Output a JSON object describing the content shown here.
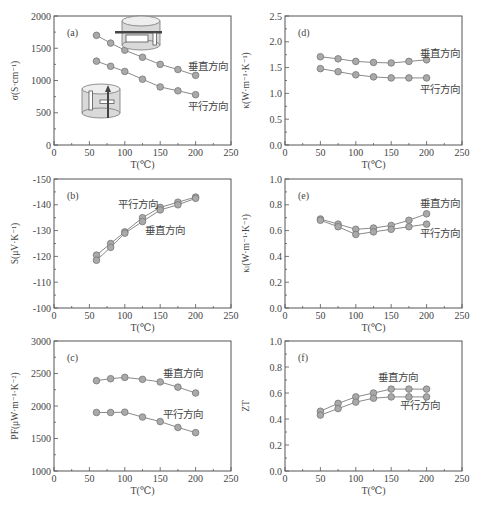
{
  "figure": {
    "width": 480,
    "height": 513
  },
  "series_names": {
    "perpendicular": "垂直方向",
    "parallel": "平行方向"
  },
  "chart_data": [
    {
      "id": "a",
      "type": "line",
      "panel_label": "(a)",
      "xlabel": "T(℃)",
      "ylabel": "σ(S·cm⁻¹)",
      "xlim": [
        0,
        250
      ],
      "ylim": [
        0,
        2000
      ],
      "xticks": [
        0,
        50,
        100,
        150,
        200,
        250
      ],
      "yticks": [
        0,
        500,
        1000,
        1500,
        2000
      ],
      "x": [
        60,
        80,
        100,
        125,
        150,
        175,
        200
      ],
      "series": [
        {
          "name": "垂直方向",
          "values": [
            1700,
            1580,
            1470,
            1360,
            1250,
            1170,
            1080
          ]
        },
        {
          "name": "平行方向",
          "values": [
            1300,
            1220,
            1140,
            1020,
            900,
            840,
            780
          ]
        }
      ],
      "annotations": [
        "垂直方向",
        "平行方向"
      ],
      "insets": [
        "cylinder-perpendicular-sample",
        "cylinder-parallel-sample"
      ]
    },
    {
      "id": "d",
      "type": "line",
      "panel_label": "(d)",
      "xlabel": "T(℃)",
      "ylabel": "κ(W·m⁻¹·K⁻¹)",
      "xlim": [
        0,
        250
      ],
      "ylim": [
        0,
        2.5
      ],
      "xticks": [
        0,
        50,
        100,
        150,
        200,
        250
      ],
      "yticks": [
        "0.0",
        "0.5",
        "1.0",
        "1.5",
        "2.0",
        "2.5"
      ],
      "x": [
        50,
        75,
        100,
        125,
        150,
        175,
        200
      ],
      "series": [
        {
          "name": "垂直方向",
          "values": [
            1.71,
            1.67,
            1.62,
            1.6,
            1.59,
            1.62,
            1.65
          ]
        },
        {
          "name": "平行方向",
          "values": [
            1.48,
            1.42,
            1.36,
            1.32,
            1.3,
            1.3,
            1.3
          ]
        }
      ],
      "annotations": [
        "垂直方向",
        "平行方向"
      ]
    },
    {
      "id": "b",
      "type": "line",
      "panel_label": "(b)",
      "xlabel": "T(℃)",
      "ylabel": "S(μV·K⁻¹)",
      "xlim": [
        0,
        250
      ],
      "ylim": [
        -100,
        -150
      ],
      "xticks": [
        0,
        50,
        100,
        150,
        200,
        250
      ],
      "yticks": [
        -100,
        -110,
        -120,
        -130,
        -140,
        -150
      ],
      "x": [
        60,
        80,
        100,
        125,
        150,
        175,
        200
      ],
      "series": [
        {
          "name": "平行方向",
          "values": [
            -120.5,
            -125,
            -129.5,
            -135,
            -139,
            -141,
            -143
          ]
        },
        {
          "name": "垂直方向",
          "values": [
            -118.5,
            -123.5,
            -129,
            -133.5,
            -138,
            -140,
            -142.5
          ]
        }
      ],
      "annotations": [
        "平行方向",
        "垂直方向"
      ]
    },
    {
      "id": "e",
      "type": "line",
      "panel_label": "(e)",
      "xlabel": "T(℃)",
      "ylabel": "κₗ(W·m⁻¹·K⁻¹)",
      "xlim": [
        0,
        250
      ],
      "ylim": [
        0,
        1.0
      ],
      "xticks": [
        0,
        50,
        100,
        150,
        200,
        250
      ],
      "yticks": [
        "0.0",
        "0.2",
        "0.4",
        "0.6",
        "0.8",
        "1.0"
      ],
      "x": [
        50,
        75,
        100,
        125,
        150,
        175,
        200
      ],
      "series": [
        {
          "name": "垂直方向",
          "values": [
            0.69,
            0.65,
            0.61,
            0.62,
            0.64,
            0.68,
            0.73
          ]
        },
        {
          "name": "平行方向",
          "values": [
            0.68,
            0.63,
            0.57,
            0.59,
            0.61,
            0.63,
            0.65
          ]
        }
      ],
      "annotations": [
        "垂直方向",
        "平行方向"
      ]
    },
    {
      "id": "c",
      "type": "line",
      "panel_label": "(c)",
      "xlabel": "T(℃)",
      "ylabel": "PF(μW·m⁻¹·K⁻²)",
      "xlim": [
        0,
        250
      ],
      "ylim": [
        1000,
        3000
      ],
      "xticks": [
        0,
        50,
        100,
        150,
        200,
        250
      ],
      "yticks": [
        1000,
        1500,
        2000,
        2500,
        3000
      ],
      "x": [
        60,
        80,
        100,
        125,
        150,
        175,
        200
      ],
      "series": [
        {
          "name": "垂直方向",
          "values": [
            2390,
            2420,
            2440,
            2410,
            2370,
            2290,
            2200
          ]
        },
        {
          "name": "平行方向",
          "values": [
            1900,
            1900,
            1905,
            1830,
            1760,
            1670,
            1590
          ]
        }
      ],
      "annotations": [
        "垂直方向",
        "平行方向"
      ]
    },
    {
      "id": "f",
      "type": "line",
      "panel_label": "(f)",
      "xlabel": "T(℃)",
      "ylabel": "ZT",
      "xlim": [
        0,
        250
      ],
      "ylim": [
        0,
        1.0
      ],
      "xticks": [
        0,
        50,
        100,
        150,
        200,
        250
      ],
      "yticks": [
        "0.0",
        "0.2",
        "0.4",
        "0.6",
        "0.8",
        "1.0"
      ],
      "x": [
        50,
        75,
        100,
        125,
        150,
        175,
        200
      ],
      "series": [
        {
          "name": "垂直方向",
          "values": [
            0.46,
            0.52,
            0.57,
            0.6,
            0.63,
            0.63,
            0.63
          ]
        },
        {
          "name": "平行方向",
          "values": [
            0.43,
            0.48,
            0.53,
            0.56,
            0.57,
            0.57,
            0.57
          ]
        }
      ],
      "annotations": [
        "垂直方向",
        "平行方向"
      ]
    }
  ],
  "layout": {
    "a": {
      "x0": 54,
      "x1": 231,
      "y0": 16,
      "y1": 145,
      "labels": [
        {
          "text": "垂直方向",
          "x": 188,
          "y": 70
        },
        {
          "text": "平行方向",
          "x": 188,
          "y": 110
        }
      ]
    },
    "d": {
      "x0": 285,
      "x1": 462,
      "y0": 16,
      "y1": 145,
      "labels": [
        {
          "text": "垂直方向",
          "x": 420,
          "y": 57
        },
        {
          "text": "平行方向",
          "x": 420,
          "y": 93
        }
      ]
    },
    "b": {
      "x0": 54,
      "x1": 231,
      "y0": 179,
      "y1": 308,
      "labels": [
        {
          "text": "平行方向",
          "x": 118,
          "y": 208
        },
        {
          "text": "垂直方向",
          "x": 145,
          "y": 234
        }
      ]
    },
    "e": {
      "x0": 285,
      "x1": 462,
      "y0": 179,
      "y1": 308,
      "labels": [
        {
          "text": "垂直方向",
          "x": 420,
          "y": 207
        },
        {
          "text": "平行方向",
          "x": 420,
          "y": 237
        }
      ]
    },
    "c": {
      "x0": 54,
      "x1": 231,
      "y0": 341,
      "y1": 471,
      "labels": [
        {
          "text": "垂直方向",
          "x": 163,
          "y": 377
        },
        {
          "text": "平行方向",
          "x": 163,
          "y": 418
        }
      ]
    },
    "f": {
      "x0": 285,
      "x1": 462,
      "y0": 341,
      "y1": 471,
      "labels": [
        {
          "text": "垂直方向",
          "x": 378,
          "y": 381
        },
        {
          "text": "平行方向",
          "x": 400,
          "y": 409
        }
      ]
    }
  }
}
